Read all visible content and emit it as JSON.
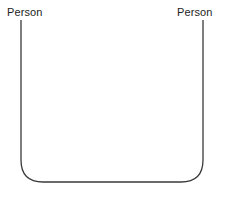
{
  "diagram": {
    "type": "sequence-diagram",
    "background_color": "#ffffff",
    "stroke_color": "#3a3a3a",
    "stroke_width": 1.3,
    "width": 227,
    "height": 198,
    "actors": [
      {
        "id": "left",
        "label": "Person",
        "label_x": 7,
        "label_y": 6,
        "lifeline_x": 21,
        "lifeline_top_y": 20
      },
      {
        "id": "right",
        "label": "Person",
        "label_x": 177,
        "label_y": 6,
        "lifeline_x": 203,
        "lifeline_top_y": 20
      }
    ],
    "connector": {
      "description": "rounded-bottom connector joining the two lifelines",
      "baseline_y": 182,
      "corner_radius": 22,
      "path": "M 21 20 L 21 160 Q 21 182 43 182 L 181 182 Q 203 182 203 160 L 203 20"
    }
  }
}
